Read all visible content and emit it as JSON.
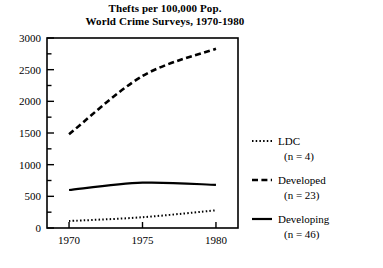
{
  "chart_data": {
    "type": "line",
    "title": "Thefts per 100,000 Pop. World Crime Surveys, 1970-1980",
    "title_lines": [
      "Thefts per 100,000 Pop.",
      "World Crime Surveys, 1970-1980"
    ],
    "xlabel": "",
    "ylabel": "",
    "x": [
      1970,
      1975,
      1980
    ],
    "xlim": [
      1968.5,
      1981.5
    ],
    "ylim": [
      0,
      3000
    ],
    "xticks": [
      1970,
      1975,
      1980
    ],
    "xtick_labels": [
      "1970",
      "1975",
      "1980"
    ],
    "yticks": [
      0,
      500,
      1000,
      1500,
      2000,
      2500,
      3000
    ],
    "ytick_labels": [
      "0",
      "500",
      "1000",
      "1500",
      "2000",
      "2500",
      "3000"
    ],
    "y_minor_ticks": [
      250,
      750,
      1250,
      1750,
      2250,
      2750
    ],
    "grid": false,
    "legend_position": "right",
    "series": [
      {
        "name": "LDC",
        "label": "LDC",
        "sublabel": "(n = 4)",
        "n": 4,
        "style": "dotted",
        "color": "#000000",
        "values": [
          110,
          170,
          280
        ]
      },
      {
        "name": "Developed",
        "label": "Developed",
        "sublabel": "(n = 23)",
        "n": 23,
        "style": "dashed",
        "color": "#000000",
        "values": [
          1480,
          2400,
          2830
        ]
      },
      {
        "name": "Developing",
        "label": "Developing",
        "sublabel": "(n = 46)",
        "n": 46,
        "style": "solid",
        "color": "#000000",
        "values": [
          600,
          715,
          680
        ]
      }
    ]
  }
}
